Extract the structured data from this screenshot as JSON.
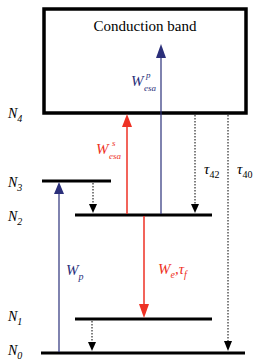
{
  "diagram": {
    "type": "energy-level-diagram",
    "band": {
      "label": "Conduction band"
    },
    "levels": [
      {
        "id": "N4",
        "main": "N",
        "sub": "4"
      },
      {
        "id": "N3",
        "main": "N",
        "sub": "3"
      },
      {
        "id": "N2",
        "main": "N",
        "sub": "2"
      },
      {
        "id": "N1",
        "main": "N",
        "sub": "1"
      },
      {
        "id": "N0",
        "main": "N",
        "sub": "0"
      }
    ],
    "transitions": {
      "wp": {
        "main": "W",
        "sub": "p",
        "from": "N0",
        "to": "N3",
        "style": "solid-arrow",
        "color": "#2b2f7a"
      },
      "wesa_p": {
        "main": "W",
        "sup": "p",
        "sub": "esa",
        "from": "N2",
        "to": "Conduction band",
        "style": "solid-arrow",
        "color": "#2b2f7a"
      },
      "wesa_s": {
        "main": "W",
        "sup": "s",
        "sub": "esa",
        "from": "N2",
        "to": "N4",
        "style": "solid-arrow",
        "color": "#ee3124"
      },
      "we_tf": {
        "main1": "W",
        "sub1": "e",
        "sep": ",",
        "main2": "τ",
        "sub2": "f",
        "from": "N2",
        "to": "N1",
        "style": "solid-arrow",
        "color": "#ee3124"
      },
      "tau42": {
        "main": "τ",
        "sub": "42",
        "from": "N4",
        "to": "N2",
        "style": "dotted-arrow",
        "color": "#000000"
      },
      "tau40": {
        "main": "τ",
        "sub": "40",
        "from": "N4",
        "to": "N0",
        "style": "dotted-arrow",
        "color": "#000000"
      },
      "n3_n2": {
        "from": "N3",
        "to": "N2",
        "style": "dotted-arrow",
        "color": "#000000"
      },
      "n1_n0": {
        "from": "N1",
        "to": "N0",
        "style": "dotted-arrow",
        "color": "#000000"
      }
    },
    "colors": {
      "level_line": "#000000",
      "pump_blue": "#2b2f7a",
      "signal_red": "#ee3124"
    }
  }
}
